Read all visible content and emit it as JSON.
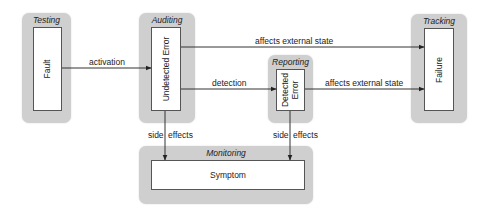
{
  "diagram": {
    "type": "state-flow",
    "colors": {
      "group_fill": "#cfcfcf",
      "node_fill": "#ffffff",
      "node_border": "#555555",
      "edge": "#333333",
      "text": "#222222"
    },
    "groups": [
      {
        "id": "testing",
        "label": "Testing",
        "node": {
          "id": "fault",
          "label": "Fault",
          "orientation": "vertical"
        }
      },
      {
        "id": "auditing",
        "label": "Auditing",
        "node": {
          "id": "undetected-error",
          "label": "Undetected Error",
          "orientation": "vertical"
        }
      },
      {
        "id": "reporting",
        "label": "Reporting",
        "node": {
          "id": "detected-error",
          "label_line1": "Detected",
          "label_line2": "Error",
          "orientation": "vertical"
        }
      },
      {
        "id": "tracking",
        "label": "Tracking",
        "node": {
          "id": "failure",
          "label": "Failure",
          "orientation": "vertical"
        }
      },
      {
        "id": "monitoring",
        "label": "Monitoring",
        "node": {
          "id": "symptom",
          "label": "Symptom",
          "orientation": "horizontal"
        }
      }
    ],
    "edges": [
      {
        "from": "fault",
        "to": "undetected-error",
        "label": "activation"
      },
      {
        "from": "undetected-error",
        "to": "failure",
        "label": "affects external state"
      },
      {
        "from": "undetected-error",
        "to": "detected-error",
        "label": "detection"
      },
      {
        "from": "detected-error",
        "to": "failure",
        "label": "affects external state"
      },
      {
        "from": "undetected-error",
        "to": "symptom",
        "label_left": "side",
        "label_right": "effects"
      },
      {
        "from": "detected-error",
        "to": "symptom",
        "label_left": "side",
        "label_right": "effects"
      }
    ]
  }
}
